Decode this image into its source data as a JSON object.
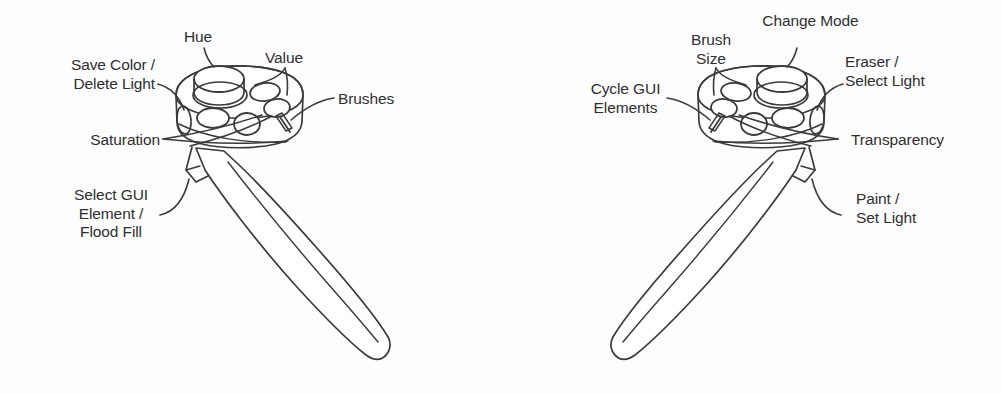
{
  "figure": {
    "background_color": "#fdfdfd",
    "line_color": "#3b3b3b",
    "text_color": "#2f2f2f"
  },
  "controllers": [
    {
      "id": "left-controller",
      "name": "Color / GUI wand",
      "orientation": "handle angled down and to the right",
      "labels": [
        {
          "key": "save_color_delete_light",
          "name": "save-color-delete-light",
          "lines": [
            "Save Color /",
            "Delete Light"
          ],
          "align": "right",
          "x": 50,
          "y": 56
        },
        {
          "key": "hue",
          "name": "hue",
          "lines": [
            "Hue"
          ],
          "align": "center",
          "x": 196,
          "y": 28
        },
        {
          "key": "value",
          "name": "value",
          "lines": [
            "Value"
          ],
          "align": "center",
          "x": 283,
          "y": 49
        },
        {
          "key": "brushes",
          "name": "brushes",
          "lines": [
            "Brushes"
          ],
          "align": "left",
          "x": 338,
          "y": 90
        },
        {
          "key": "saturation",
          "name": "saturation",
          "lines": [
            "Saturation"
          ],
          "align": "right",
          "x": 68,
          "y": 131
        },
        {
          "key": "select_gui_element_flood_fill",
          "name": "select-gui-element-flood-fill",
          "lines": [
            "Select GUI",
            "Element /",
            "Flood Fill"
          ],
          "align": "center",
          "x": 60,
          "y": 186
        }
      ]
    },
    {
      "id": "right-controller",
      "name": "Paint / light wand",
      "orientation": "handle angled down and to the left",
      "labels": [
        {
          "key": "change_mode",
          "name": "change-mode",
          "lines": [
            "Change Mode"
          ],
          "align": "center",
          "x": 755,
          "y": 12
        },
        {
          "key": "brush_size",
          "name": "brush-size",
          "lines": [
            "Brush",
            "Size"
          ],
          "align": "center",
          "x": 690,
          "y": 31
        },
        {
          "key": "eraser_select_light",
          "name": "eraser-select-light",
          "lines": [
            "Eraser /",
            "Select Light"
          ],
          "align": "left",
          "x": 845,
          "y": 53
        },
        {
          "key": "cycle_gui_elements",
          "name": "cycle-gui-elements",
          "lines": [
            "Cycle GUI",
            "Elements"
          ],
          "align": "center",
          "x": 578,
          "y": 80
        },
        {
          "key": "transparency",
          "name": "transparency",
          "lines": [
            "Transparency"
          ],
          "align": "left",
          "x": 851,
          "y": 131
        },
        {
          "key": "paint_set_light",
          "name": "paint-set-light",
          "lines": [
            "Paint /",
            "Set Light"
          ],
          "align": "left",
          "x": 856,
          "y": 190
        }
      ]
    }
  ]
}
